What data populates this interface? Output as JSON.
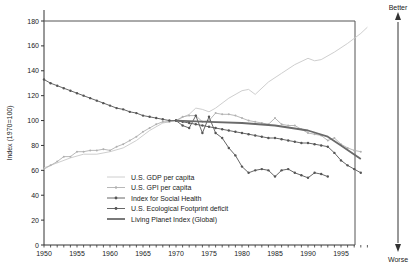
{
  "chart_data": {
    "type": "line",
    "title": "",
    "xlabel": "",
    "ylabel": "Index (1970=100)",
    "xlim": [
      1950,
      2000
    ],
    "ylim": [
      0,
      180
    ],
    "grid": false,
    "legend_position": "inside lower-left-center",
    "x_ticks": [
      "1950",
      "1955",
      "1960",
      "1965",
      "1970",
      "1975",
      "1980",
      "1985",
      "1990",
      "1995"
    ],
    "y_ticks": [
      "0",
      "20",
      "40",
      "60",
      "80",
      "100",
      "120",
      "140",
      "160",
      "180"
    ],
    "side_scale": {
      "top": "Better",
      "bottom": "Worse"
    },
    "series": [
      {
        "name": "U.S. GDP per capita",
        "style": "thin light line",
        "color": "#c8c8c8",
        "x": [
          1950,
          1952,
          1954,
          1956,
          1958,
          1960,
          1962,
          1964,
          1966,
          1968,
          1970,
          1972,
          1973,
          1974,
          1975,
          1976,
          1978,
          1980,
          1981,
          1982,
          1984,
          1986,
          1988,
          1990,
          1991,
          1992,
          1994,
          1996,
          1998,
          1999
        ],
        "values": [
          62,
          66,
          70,
          73,
          73,
          75,
          78,
          84,
          92,
          98,
          100,
          105,
          110,
          109,
          107,
          110,
          118,
          124,
          125,
          121,
          131,
          138,
          145,
          150,
          148,
          149,
          155,
          162,
          170,
          175
        ]
      },
      {
        "name": "U.S. GPI per capita",
        "style": "light line with small markers",
        "color": "#b4b4b4",
        "x": [
          1950,
          1951,
          1952,
          1953,
          1954,
          1955,
          1956,
          1957,
          1958,
          1959,
          1960,
          1961,
          1962,
          1963,
          1964,
          1965,
          1966,
          1967,
          1968,
          1969,
          1970,
          1971,
          1972,
          1973,
          1974,
          1975,
          1976,
          1977,
          1978,
          1979,
          1980,
          1981,
          1982,
          1983,
          1984,
          1985,
          1986,
          1987,
          1988,
          1989,
          1990,
          1991,
          1992,
          1993,
          1994,
          1995,
          1996,
          1997,
          1998
        ],
        "values": [
          61,
          64,
          67,
          71,
          71,
          75,
          75,
          76,
          76,
          77,
          76,
          79,
          81,
          84,
          87,
          91,
          94,
          97,
          99,
          99,
          100,
          103,
          104,
          104,
          99,
          100,
          106,
          105,
          105,
          104,
          102,
          100,
          99,
          98,
          97,
          102,
          97,
          96,
          96,
          93,
          90,
          89,
          88,
          84,
          86,
          81,
          78,
          76,
          75
        ]
      },
      {
        "name": "Index for Social Health",
        "style": "dark line with dot markers",
        "color": "#555555",
        "x": [
          1970,
          1971,
          1972,
          1973,
          1974,
          1975,
          1976,
          1977,
          1978,
          1979,
          1980,
          1981,
          1982,
          1983,
          1984,
          1985,
          1986,
          1987,
          1988,
          1989,
          1990,
          1991,
          1992,
          1993
        ],
        "values": [
          100,
          96,
          94,
          104,
          90,
          103,
          90,
          86,
          78,
          72,
          63,
          58,
          60,
          61,
          60,
          55,
          60,
          61,
          58,
          56,
          54,
          58,
          57,
          55
        ]
      },
      {
        "name": "U.S. Ecological Footprint deficit",
        "style": "dark line with dot markers",
        "color": "#555555",
        "x": [
          1950,
          1951,
          1952,
          1953,
          1954,
          1955,
          1956,
          1957,
          1958,
          1959,
          1960,
          1961,
          1962,
          1963,
          1964,
          1965,
          1966,
          1967,
          1968,
          1969,
          1970,
          1971,
          1972,
          1973,
          1974,
          1975,
          1976,
          1977,
          1978,
          1979,
          1980,
          1981,
          1982,
          1983,
          1984,
          1985,
          1986,
          1987,
          1988,
          1989,
          1990,
          1991,
          1992,
          1993,
          1994,
          1995,
          1996,
          1997,
          1998
        ],
        "values": [
          133,
          130,
          128,
          126,
          124,
          122,
          120,
          118,
          116,
          114,
          112,
          110,
          109,
          107,
          106,
          104,
          103,
          102,
          101,
          100,
          100,
          99,
          98,
          97,
          96,
          95,
          94,
          93,
          92,
          91,
          90,
          89,
          88,
          87,
          86,
          86,
          85,
          84,
          83,
          82,
          82,
          81,
          80,
          79,
          74,
          68,
          64,
          61,
          58
        ]
      },
      {
        "name": "Living Planet Index (Global)",
        "style": "thick dark line",
        "color": "#666666",
        "x": [
          1970,
          1975,
          1980,
          1985,
          1990,
          1993,
          1995,
          1998
        ],
        "values": [
          100,
          99,
          98,
          96,
          92,
          87,
          80,
          69
        ]
      }
    ]
  },
  "legend": [
    {
      "label": "U.S. GDP per capita",
      "marker": "none",
      "color": "#c8c8c8"
    },
    {
      "label": "U.S. GPI per capita",
      "marker": "dot",
      "color": "#b4b4b4"
    },
    {
      "label": "Index for Social Health",
      "marker": "dot",
      "color": "#555555"
    },
    {
      "label": "U.S. Ecological Footprint deficit",
      "marker": "dot",
      "color": "#555555"
    },
    {
      "label": "Living Planet Index (Global)",
      "marker": "thick",
      "color": "#666666"
    }
  ],
  "labels": {
    "ylabel": "Index (1970=100)",
    "better": "Better",
    "worse": "Worse"
  }
}
